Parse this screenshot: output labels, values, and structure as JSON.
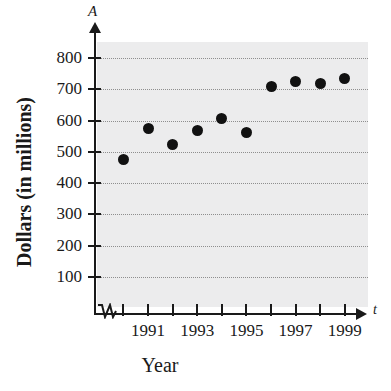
{
  "chart_data": {
    "type": "scatter",
    "title": "",
    "xlabel": "Year",
    "ylabel": "Dollars (in millions)",
    "x_axis_variable": "t",
    "y_axis_variable": "A",
    "grid": true,
    "legend": "none",
    "axis_break_x": true,
    "xlim": [
      1989.5,
      1999.8
    ],
    "ylim": [
      0,
      850
    ],
    "x_tick_values": [
      1990,
      1991,
      1992,
      1993,
      1994,
      1995,
      1996,
      1997,
      1998,
      1999
    ],
    "x_tick_labels": [
      "",
      "1991",
      "",
      "1993",
      "",
      "1995",
      "",
      "1997",
      "",
      "1999"
    ],
    "y_tick_values": [
      100,
      200,
      300,
      400,
      500,
      600,
      700,
      800
    ],
    "y_tick_labels": [
      "100",
      "200",
      "300",
      "400",
      "500",
      "600",
      "700",
      "800"
    ],
    "x": [
      1990,
      1991,
      1992,
      1993,
      1994,
      1995,
      1996,
      1997,
      1998,
      1999
    ],
    "values": [
      475,
      575,
      522,
      568,
      608,
      563,
      708,
      725,
      720,
      733
    ],
    "points": [
      {
        "x": 1990,
        "y": 475
      },
      {
        "x": 1991,
        "y": 575
      },
      {
        "x": 1992,
        "y": 522
      },
      {
        "x": 1993,
        "y": 568
      },
      {
        "x": 1994,
        "y": 608
      },
      {
        "x": 1995,
        "y": 563
      },
      {
        "x": 1996,
        "y": 708
      },
      {
        "x": 1997,
        "y": 725
      },
      {
        "x": 1998,
        "y": 720
      },
      {
        "x": 1999,
        "y": 733
      }
    ],
    "colors": {
      "marker": "#111111",
      "panel_background": "#ececed",
      "gridline": "#8e8e8e",
      "axis": "#1a1a1a",
      "page_background": "#ffffff"
    }
  }
}
